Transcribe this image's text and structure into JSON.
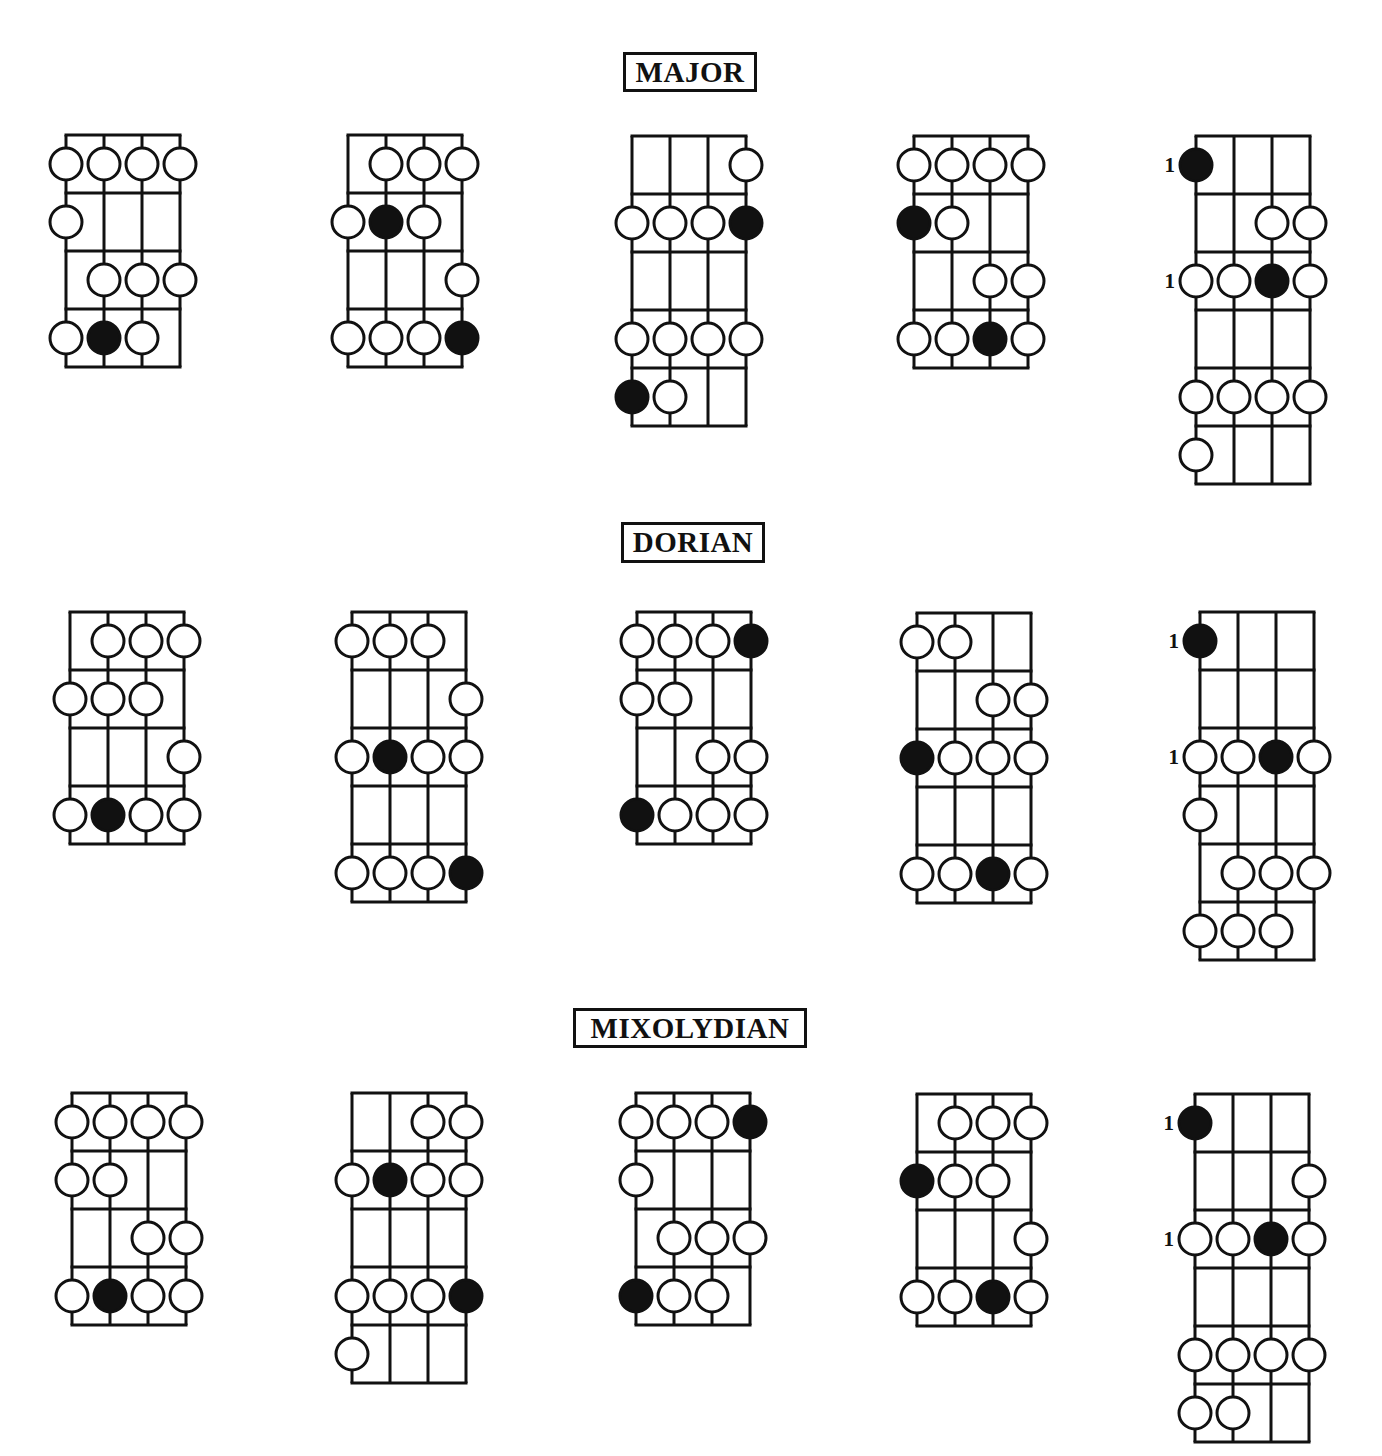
{
  "sections": [
    {
      "title": "MAJOR",
      "title_box": {
        "x": 623,
        "y": 52,
        "w": 134,
        "h": 40
      },
      "diagrams": [
        {
          "x": 66,
          "y": 135,
          "rows": 4,
          "dots": [
            [
              0,
              0,
              "o"
            ],
            [
              0,
              1,
              "o"
            ],
            [
              0,
              2,
              "o"
            ],
            [
              0,
              3,
              "o"
            ],
            [
              1,
              0,
              "o"
            ],
            [
              2,
              1,
              "o"
            ],
            [
              2,
              2,
              "o"
            ],
            [
              2,
              3,
              "o"
            ],
            [
              3,
              0,
              "o"
            ],
            [
              3,
              1,
              "f"
            ],
            [
              3,
              2,
              "o"
            ]
          ],
          "labels": []
        },
        {
          "x": 348,
          "y": 135,
          "rows": 4,
          "dots": [
            [
              0,
              1,
              "o"
            ],
            [
              0,
              2,
              "o"
            ],
            [
              0,
              3,
              "o"
            ],
            [
              1,
              0,
              "o"
            ],
            [
              1,
              1,
              "f"
            ],
            [
              1,
              2,
              "o"
            ],
            [
              2,
              3,
              "o"
            ],
            [
              3,
              0,
              "o"
            ],
            [
              3,
              1,
              "o"
            ],
            [
              3,
              2,
              "o"
            ],
            [
              3,
              3,
              "f"
            ]
          ],
          "labels": []
        },
        {
          "x": 632,
          "y": 136,
          "rows": 5,
          "dots": [
            [
              0,
              3,
              "o"
            ],
            [
              1,
              0,
              "o"
            ],
            [
              1,
              1,
              "o"
            ],
            [
              1,
              2,
              "o"
            ],
            [
              1,
              3,
              "f"
            ],
            [
              3,
              0,
              "o"
            ],
            [
              3,
              1,
              "o"
            ],
            [
              3,
              2,
              "o"
            ],
            [
              3,
              3,
              "o"
            ],
            [
              4,
              0,
              "f"
            ],
            [
              4,
              1,
              "o"
            ]
          ],
          "labels": []
        },
        {
          "x": 914,
          "y": 136,
          "rows": 4,
          "dots": [
            [
              0,
              0,
              "o"
            ],
            [
              0,
              1,
              "o"
            ],
            [
              0,
              2,
              "o"
            ],
            [
              0,
              3,
              "o"
            ],
            [
              1,
              0,
              "f"
            ],
            [
              1,
              1,
              "o"
            ],
            [
              2,
              2,
              "o"
            ],
            [
              2,
              3,
              "o"
            ],
            [
              3,
              0,
              "o"
            ],
            [
              3,
              1,
              "o"
            ],
            [
              3,
              2,
              "f"
            ],
            [
              3,
              3,
              "o"
            ]
          ],
          "labels": []
        },
        {
          "x": 1196,
          "y": 136,
          "rows": 6,
          "dots": [
            [
              0,
              0,
              "f"
            ],
            [
              1,
              2,
              "o"
            ],
            [
              1,
              3,
              "o"
            ],
            [
              2,
              0,
              "o"
            ],
            [
              2,
              1,
              "o"
            ],
            [
              2,
              2,
              "f"
            ],
            [
              2,
              3,
              "o"
            ],
            [
              4,
              0,
              "o"
            ],
            [
              4,
              1,
              "o"
            ],
            [
              4,
              2,
              "o"
            ],
            [
              4,
              3,
              "o"
            ],
            [
              5,
              0,
              "o"
            ]
          ],
          "labels": [
            {
              "row": 0,
              "text": "1"
            },
            {
              "row": 2,
              "text": "1"
            }
          ]
        }
      ]
    },
    {
      "title": "DORIAN",
      "title_box": {
        "x": 621,
        "y": 522,
        "w": 144,
        "h": 41
      },
      "diagrams": [
        {
          "x": 70,
          "y": 612,
          "rows": 4,
          "dots": [
            [
              0,
              1,
              "o"
            ],
            [
              0,
              2,
              "o"
            ],
            [
              0,
              3,
              "o"
            ],
            [
              1,
              0,
              "o"
            ],
            [
              1,
              1,
              "o"
            ],
            [
              1,
              2,
              "o"
            ],
            [
              2,
              3,
              "o"
            ],
            [
              3,
              0,
              "o"
            ],
            [
              3,
              1,
              "f"
            ],
            [
              3,
              2,
              "o"
            ],
            [
              3,
              3,
              "o"
            ]
          ],
          "labels": []
        },
        {
          "x": 352,
          "y": 612,
          "rows": 5,
          "dots": [
            [
              0,
              0,
              "o"
            ],
            [
              0,
              1,
              "o"
            ],
            [
              0,
              2,
              "o"
            ],
            [
              1,
              3,
              "o"
            ],
            [
              2,
              0,
              "o"
            ],
            [
              2,
              1,
              "f"
            ],
            [
              2,
              2,
              "o"
            ],
            [
              2,
              3,
              "o"
            ],
            [
              4,
              0,
              "o"
            ],
            [
              4,
              1,
              "o"
            ],
            [
              4,
              2,
              "o"
            ],
            [
              4,
              3,
              "f"
            ]
          ],
          "labels": []
        },
        {
          "x": 637,
          "y": 612,
          "rows": 4,
          "dots": [
            [
              0,
              0,
              "o"
            ],
            [
              0,
              1,
              "o"
            ],
            [
              0,
              2,
              "o"
            ],
            [
              0,
              3,
              "f"
            ],
            [
              1,
              0,
              "o"
            ],
            [
              1,
              1,
              "o"
            ],
            [
              2,
              2,
              "o"
            ],
            [
              2,
              3,
              "o"
            ],
            [
              3,
              0,
              "f"
            ],
            [
              3,
              1,
              "o"
            ],
            [
              3,
              2,
              "o"
            ],
            [
              3,
              3,
              "o"
            ]
          ],
          "labels": []
        },
        {
          "x": 917,
          "y": 613,
          "rows": 5,
          "dots": [
            [
              0,
              0,
              "o"
            ],
            [
              0,
              1,
              "o"
            ],
            [
              1,
              2,
              "o"
            ],
            [
              1,
              3,
              "o"
            ],
            [
              2,
              0,
              "f"
            ],
            [
              2,
              1,
              "o"
            ],
            [
              2,
              2,
              "o"
            ],
            [
              2,
              3,
              "o"
            ],
            [
              4,
              0,
              "o"
            ],
            [
              4,
              1,
              "o"
            ],
            [
              4,
              2,
              "f"
            ],
            [
              4,
              3,
              "o"
            ]
          ],
          "labels": []
        },
        {
          "x": 1200,
          "y": 612,
          "rows": 6,
          "dots": [
            [
              0,
              0,
              "f"
            ],
            [
              2,
              0,
              "o"
            ],
            [
              2,
              1,
              "o"
            ],
            [
              2,
              2,
              "f"
            ],
            [
              2,
              3,
              "o"
            ],
            [
              3,
              0,
              "o"
            ],
            [
              4,
              1,
              "o"
            ],
            [
              4,
              2,
              "o"
            ],
            [
              4,
              3,
              "o"
            ],
            [
              5,
              0,
              "o"
            ],
            [
              5,
              1,
              "o"
            ],
            [
              5,
              2,
              "o"
            ]
          ],
          "labels": [
            {
              "row": 0,
              "text": "1"
            },
            {
              "row": 2,
              "text": "1"
            }
          ]
        }
      ]
    },
    {
      "title": "MIXOLYDIAN",
      "title_box": {
        "x": 573,
        "y": 1008,
        "w": 234,
        "h": 40
      },
      "diagrams": [
        {
          "x": 72,
          "y": 1093,
          "rows": 4,
          "dots": [
            [
              0,
              0,
              "o"
            ],
            [
              0,
              1,
              "o"
            ],
            [
              0,
              2,
              "o"
            ],
            [
              0,
              3,
              "o"
            ],
            [
              1,
              0,
              "o"
            ],
            [
              1,
              1,
              "o"
            ],
            [
              2,
              2,
              "o"
            ],
            [
              2,
              3,
              "o"
            ],
            [
              3,
              0,
              "o"
            ],
            [
              3,
              1,
              "f"
            ],
            [
              3,
              2,
              "o"
            ],
            [
              3,
              3,
              "o"
            ]
          ],
          "labels": []
        },
        {
          "x": 352,
          "y": 1093,
          "rows": 5,
          "dots": [
            [
              0,
              2,
              "o"
            ],
            [
              0,
              3,
              "o"
            ],
            [
              1,
              0,
              "o"
            ],
            [
              1,
              1,
              "f"
            ],
            [
              1,
              2,
              "o"
            ],
            [
              1,
              3,
              "o"
            ],
            [
              3,
              0,
              "o"
            ],
            [
              3,
              1,
              "o"
            ],
            [
              3,
              2,
              "o"
            ],
            [
              3,
              3,
              "f"
            ],
            [
              4,
              0,
              "o"
            ]
          ],
          "labels": []
        },
        {
          "x": 636,
          "y": 1093,
          "rows": 4,
          "dots": [
            [
              0,
              0,
              "o"
            ],
            [
              0,
              1,
              "o"
            ],
            [
              0,
              2,
              "o"
            ],
            [
              0,
              3,
              "f"
            ],
            [
              1,
              0,
              "o"
            ],
            [
              2,
              1,
              "o"
            ],
            [
              2,
              2,
              "o"
            ],
            [
              2,
              3,
              "o"
            ],
            [
              3,
              0,
              "f"
            ],
            [
              3,
              1,
              "o"
            ],
            [
              3,
              2,
              "o"
            ]
          ],
          "labels": []
        },
        {
          "x": 917,
          "y": 1094,
          "rows": 4,
          "dots": [
            [
              0,
              1,
              "o"
            ],
            [
              0,
              2,
              "o"
            ],
            [
              0,
              3,
              "o"
            ],
            [
              1,
              0,
              "f"
            ],
            [
              1,
              1,
              "o"
            ],
            [
              1,
              2,
              "o"
            ],
            [
              2,
              3,
              "o"
            ],
            [
              3,
              0,
              "o"
            ],
            [
              3,
              1,
              "o"
            ],
            [
              3,
              2,
              "f"
            ],
            [
              3,
              3,
              "o"
            ]
          ],
          "labels": []
        },
        {
          "x": 1195,
          "y": 1094,
          "rows": 6,
          "dots": [
            [
              0,
              0,
              "f"
            ],
            [
              1,
              3,
              "o"
            ],
            [
              2,
              0,
              "o"
            ],
            [
              2,
              1,
              "o"
            ],
            [
              2,
              2,
              "f"
            ],
            [
              2,
              3,
              "o"
            ],
            [
              4,
              0,
              "o"
            ],
            [
              4,
              1,
              "o"
            ],
            [
              4,
              2,
              "o"
            ],
            [
              4,
              3,
              "o"
            ],
            [
              5,
              0,
              "o"
            ],
            [
              5,
              1,
              "o"
            ]
          ],
          "labels": [
            {
              "row": 0,
              "text": "1"
            },
            {
              "row": 2,
              "text": "1"
            }
          ]
        }
      ]
    }
  ],
  "style": {
    "line_color": "#111111",
    "fill_open": "#ffffff",
    "fill_root": "#111111",
    "background": "#ffffff",
    "string_spacing": 38,
    "row_height": 58,
    "dot_radius": 16,
    "stroke_width": 3
  }
}
